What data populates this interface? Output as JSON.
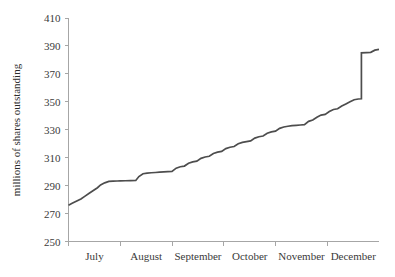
{
  "chart_data": {
    "type": "line",
    "title": "",
    "subtitle": "",
    "xlabel": "",
    "ylabel": "millions of shares outstanding",
    "ylim": [
      250,
      410
    ],
    "yticks": [
      250,
      270,
      290,
      310,
      330,
      350,
      370,
      390,
      410
    ],
    "ytick_labels": [
      "250",
      "270",
      "290",
      "310",
      "330",
      "350",
      "370",
      "390",
      "410"
    ],
    "xlim": [
      0,
      6
    ],
    "xticks": [
      0,
      1,
      2,
      3,
      4,
      5
    ],
    "xtick_labels": [
      "July",
      "August",
      "September",
      "October",
      "November",
      "December"
    ],
    "grid": false,
    "legend": null,
    "legend_position": "none",
    "series": [
      {
        "name": "shares outstanding",
        "color": "#4d4d4d",
        "x": [
          0.0,
          0.08,
          0.16,
          0.24,
          0.32,
          0.4,
          0.48,
          0.56,
          0.62,
          0.7,
          0.78,
          0.86,
          0.94,
          1.0,
          1.1,
          1.2,
          1.3,
          1.36,
          1.44,
          1.52,
          1.6,
          1.68,
          1.76,
          1.84,
          1.92,
          2.0,
          2.08,
          2.16,
          2.24,
          2.32,
          2.4,
          2.48,
          2.56,
          2.64,
          2.72,
          2.8,
          2.88,
          2.96,
          3.04,
          3.12,
          3.2,
          3.28,
          3.36,
          3.44,
          3.52,
          3.6,
          3.68,
          3.76,
          3.84,
          3.92,
          4.0,
          4.08,
          4.16,
          4.24,
          4.32,
          4.4,
          4.48,
          4.56,
          4.64,
          4.72,
          4.8,
          4.88,
          4.96,
          5.04,
          5.12,
          5.2,
          5.28,
          5.36,
          5.44,
          5.52,
          5.6,
          5.66,
          5.66,
          5.76,
          5.84,
          5.92,
          6.0
        ],
        "y": [
          276.0,
          277.5,
          279.0,
          280.5,
          282.5,
          284.5,
          286.5,
          288.5,
          290.5,
          292.0,
          293.0,
          293.2,
          293.3,
          293.4,
          293.5,
          293.6,
          293.7,
          296.5,
          298.5,
          299.0,
          299.2,
          299.4,
          299.6,
          299.8,
          300.0,
          300.2,
          302.5,
          303.5,
          304.0,
          306.0,
          307.0,
          307.5,
          309.5,
          310.5,
          311.0,
          313.0,
          314.0,
          314.5,
          316.5,
          317.5,
          318.0,
          320.0,
          321.0,
          321.5,
          322.0,
          324.0,
          325.0,
          325.5,
          327.5,
          328.5,
          329.0,
          331.0,
          332.0,
          332.5,
          333.0,
          333.2,
          333.4,
          333.6,
          336.0,
          337.0,
          339.0,
          340.5,
          341.0,
          343.0,
          344.5,
          345.0,
          347.0,
          348.5,
          350.0,
          351.5,
          352.0,
          352.2,
          385.0,
          385.2,
          385.4,
          387.0,
          387.5
        ]
      }
    ]
  },
  "axes": {
    "y_axis_title": "millions of shares outstanding"
  }
}
